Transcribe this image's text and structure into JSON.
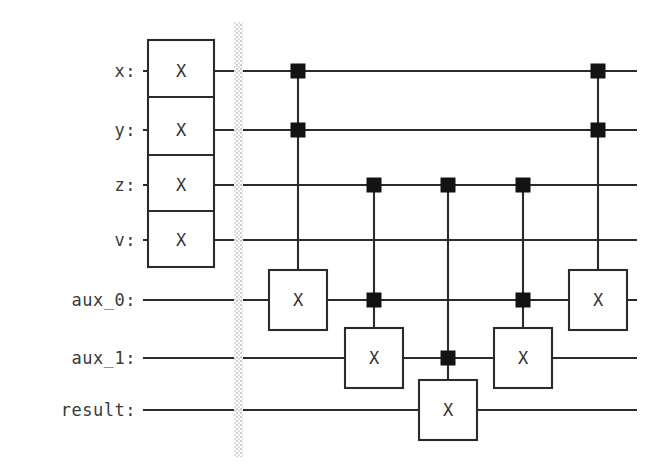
{
  "diagram": {
    "type": "quantum-circuit",
    "background_color": "#ffffff",
    "ink_color": "#2b2b2b",
    "control_color": "#131313",
    "barrier_color": "#cfcfcf"
  },
  "wires": [
    {
      "id": "x",
      "label": "x:",
      "y": 71,
      "index": 0
    },
    {
      "id": "y",
      "label": "y:",
      "y": 130,
      "index": 1
    },
    {
      "id": "z",
      "label": "z:",
      "y": 185,
      "index": 2
    },
    {
      "id": "v",
      "label": "v:",
      "y": 240,
      "index": 3
    },
    {
      "id": "aux_0",
      "label": "aux_0:",
      "y": 300,
      "index": 4
    },
    {
      "id": "aux_1",
      "label": "aux_1:",
      "y": 358,
      "index": 5
    },
    {
      "id": "result",
      "label": "result:",
      "y": 410,
      "index": 6
    }
  ],
  "wire_extent": {
    "x_start": 143,
    "x_end": 637
  },
  "label_x": 136,
  "barrier": {
    "x": 234,
    "width": 9,
    "y_top": 22,
    "y_bottom": 457
  },
  "init_block": {
    "name": "initial-x-gates",
    "x": 148,
    "width": 66,
    "y_top": 40,
    "y_bottom": 267,
    "gate_label": "X",
    "wires": [
      "x",
      "y",
      "z",
      "v"
    ],
    "dividers_y": [
      97,
      155,
      211
    ]
  },
  "columns": [
    {
      "id": "col-1",
      "x": 298,
      "controls_y": [
        71,
        130
      ],
      "control_wires": [
        "x",
        "y"
      ],
      "target": {
        "wire": "aux_0",
        "y": 300,
        "label": "X",
        "w": 58,
        "h": 60
      }
    },
    {
      "id": "col-2",
      "x": 374,
      "controls_y": [
        185,
        300
      ],
      "control_wires": [
        "z",
        "aux_0"
      ],
      "target": {
        "wire": "aux_1",
        "y": 358,
        "label": "X",
        "w": 58,
        "h": 60
      }
    },
    {
      "id": "col-3",
      "x": 448,
      "controls_y": [
        185,
        358
      ],
      "control_wires": [
        "z",
        "aux_1"
      ],
      "target": {
        "wire": "result",
        "y": 410,
        "label": "X",
        "w": 58,
        "h": 60
      }
    },
    {
      "id": "col-4",
      "x": 523,
      "controls_y": [
        185,
        300
      ],
      "control_wires": [
        "z",
        "aux_0"
      ],
      "target": {
        "wire": "aux_1",
        "y": 358,
        "label": "X",
        "w": 58,
        "h": 60
      }
    },
    {
      "id": "col-5",
      "x": 598,
      "controls_y": [
        71,
        130
      ],
      "control_wires": [
        "x",
        "y"
      ],
      "target": {
        "wire": "aux_0",
        "y": 300,
        "label": "X",
        "w": 58,
        "h": 60
      }
    }
  ],
  "control_square": {
    "size": 14
  }
}
